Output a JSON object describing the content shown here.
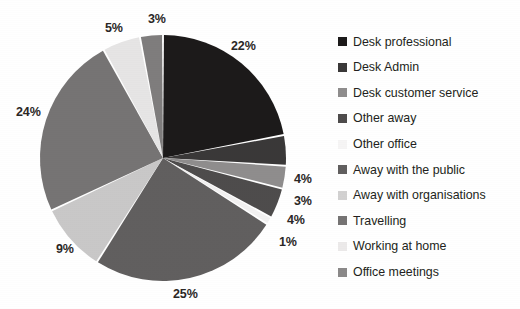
{
  "chart_data": {
    "type": "pie",
    "title": "",
    "legend_position": "right",
    "start_angle": 0,
    "direction": "clockwise",
    "labels_show_percent": true,
    "categories": [
      "Desk professional",
      "Desk Admin",
      "Desk customer service",
      "Other away",
      "Other office",
      "Away with the public",
      "Away with organisations",
      "Travelling",
      "Working at home",
      "Office meetings"
    ],
    "values": [
      22,
      4,
      3,
      4,
      1,
      25,
      9,
      24,
      5,
      3
    ],
    "value_labels": [
      "22%",
      "4%",
      "3%",
      "4%",
      "1%",
      "25%",
      "9%",
      "24%",
      "5%",
      "3%"
    ],
    "colors": [
      "#1c1a1a",
      "#3a3838",
      "#8f8d8d",
      "#4e4c4c",
      "#f2f1f1",
      "#615f5f",
      "#c9c8c8",
      "#767474",
      "#e6e5e5",
      "#7f7d7d"
    ]
  },
  "pie": {
    "center_x": 163,
    "center_y": 158,
    "radius": 123,
    "slices": [
      {
        "name": "Desk professional",
        "label": "22%",
        "value": 22,
        "color": "#1c1a1a",
        "label_x": 231,
        "label_y": 40
      },
      {
        "name": "Desk Admin",
        "label": "4%",
        "value": 4,
        "color": "#3a3838",
        "label_x": 294,
        "label_y": 173
      },
      {
        "name": "Desk customer service",
        "label": "3%",
        "value": 3,
        "color": "#8f8d8d",
        "label_x": 294,
        "label_y": 195
      },
      {
        "name": "Other away",
        "label": "4%",
        "value": 4,
        "color": "#4e4c4c",
        "label_x": 287,
        "label_y": 214
      },
      {
        "name": "Other office",
        "label": "1%",
        "value": 1,
        "color": "#f2f1f1",
        "label_x": 279,
        "label_y": 236
      },
      {
        "name": "Away with the public",
        "label": "25%",
        "value": 25,
        "color": "#615f5f",
        "label_x": 173,
        "label_y": 288
      },
      {
        "name": "Away with organisations",
        "label": "9%",
        "value": 9,
        "color": "#c9c8c8",
        "label_x": 56,
        "label_y": 243
      },
      {
        "name": "Travelling",
        "label": "24%",
        "value": 24,
        "color": "#767474",
        "label_x": 16,
        "label_y": 106
      },
      {
        "name": "Working at home",
        "label": "5%",
        "value": 5,
        "color": "#e6e5e5",
        "label_x": 105,
        "label_y": 22
      },
      {
        "name": "Office meetings",
        "label": "3%",
        "value": 3,
        "color": "#7f7d7d",
        "label_x": 148,
        "label_y": 13
      }
    ]
  },
  "legend": {
    "items": [
      {
        "label": "Desk professional",
        "color": "#1c1a1a"
      },
      {
        "label": "Desk Admin",
        "color": "#3a3838"
      },
      {
        "label": "Desk customer service",
        "color": "#8f8d8d"
      },
      {
        "label": "Other away",
        "color": "#4e4c4c"
      },
      {
        "label": "Other office",
        "color": "#f6f5f5"
      },
      {
        "label": "Away with the public",
        "color": "#615f5f"
      },
      {
        "label": "Away with organisations",
        "color": "#d2d1d1"
      },
      {
        "label": "Travelling",
        "color": "#767474"
      },
      {
        "label": "Working at home",
        "color": "#eceaea"
      },
      {
        "label": "Office meetings",
        "color": "#8b8989"
      }
    ]
  }
}
